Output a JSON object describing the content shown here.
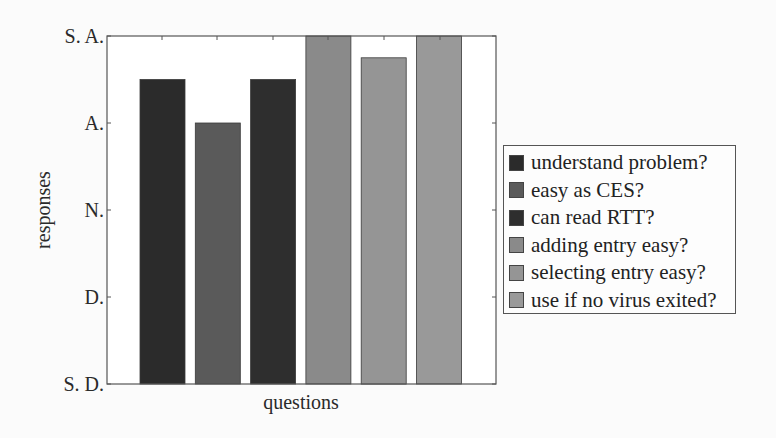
{
  "chart_data": {
    "type": "bar",
    "title": "",
    "xlabel": "questions",
    "ylabel": "responses",
    "y_ticks": [
      {
        "value": 1,
        "label": "S. D."
      },
      {
        "value": 2,
        "label": "D."
      },
      {
        "value": 3,
        "label": "N."
      },
      {
        "value": 4,
        "label": "A."
      },
      {
        "value": 5,
        "label": "S. A."
      }
    ],
    "ylim": [
      1,
      5
    ],
    "grid": false,
    "legend_position": "right",
    "categories": [
      "understand problem?",
      "easy as CES?",
      "can read RTT?",
      "adding entry easy?",
      "selecting entry easy?",
      "use if no virus exited?"
    ],
    "values": [
      4.5,
      4.0,
      4.5,
      5.0,
      4.75,
      5.0
    ],
    "colors": [
      "#2b2b2b",
      "#5a5a5a",
      "#2e2e2e",
      "#8a8a8a",
      "#959595",
      "#999999"
    ]
  },
  "legend": {
    "items": [
      {
        "label": "understand problem?",
        "color": "#2b2b2b"
      },
      {
        "label": "easy as CES?",
        "color": "#5a5a5a"
      },
      {
        "label": "can read RTT?",
        "color": "#2e2e2e"
      },
      {
        "label": "adding entry easy?",
        "color": "#8a8a8a"
      },
      {
        "label": "selecting entry easy?",
        "color": "#959595"
      },
      {
        "label": "use if no virus exited?",
        "color": "#999999"
      }
    ]
  }
}
